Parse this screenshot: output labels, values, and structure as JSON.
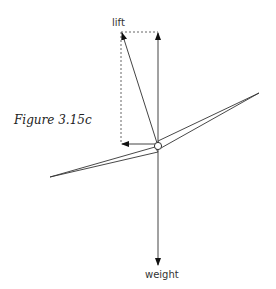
{
  "figure": {
    "caption": "Figure 3.15c",
    "labels": {
      "lift": "lift",
      "weight": "weight"
    },
    "colors": {
      "line": "#444444",
      "dashed": "#666666",
      "background": "#ffffff"
    }
  }
}
